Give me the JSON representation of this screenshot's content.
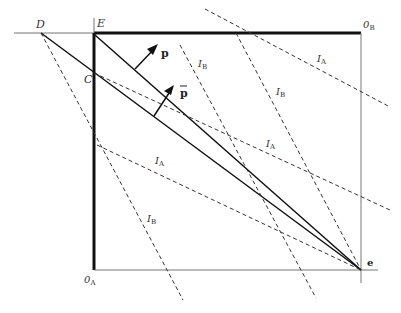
{
  "diagram": {
    "type": "edgeworth-box",
    "points": {
      "D": "D",
      "E": "E",
      "C": "C",
      "origin_a": "0",
      "origin_a_sub": "A",
      "origin_b": "0",
      "origin_b_sub": "B",
      "endowment": "e"
    },
    "vectors": {
      "p": "p",
      "p_bar": "p"
    },
    "indifference_labels": [
      {
        "main": "I",
        "sub": "A",
        "id": "ia-upper"
      },
      {
        "main": "I",
        "sub": "A",
        "id": "ia-middle"
      },
      {
        "main": "I",
        "sub": "A",
        "id": "ia-lower"
      },
      {
        "main": "I",
        "sub": "B",
        "id": "ib-left"
      },
      {
        "main": "I",
        "sub": "B",
        "id": "ib-middle"
      },
      {
        "main": "I",
        "sub": "B",
        "id": "ib-right"
      }
    ]
  }
}
